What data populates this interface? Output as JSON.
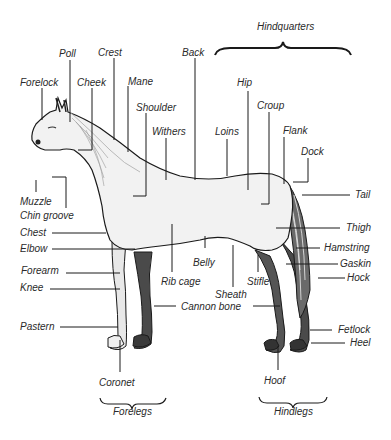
{
  "diagram": {
    "groups": {
      "hindquarters": "Hindquarters",
      "forelegs": "Forelegs",
      "hindlegs": "Hindlegs"
    },
    "labels": {
      "poll": "Poll",
      "crest": "Crest",
      "back": "Back",
      "forelock": "Forelock",
      "cheek": "Cheek",
      "mane": "Mane",
      "shoulder": "Shoulder",
      "withers": "Withers",
      "hip": "Hip",
      "croup": "Croup",
      "loins": "Loins",
      "flank": "Flank",
      "dock": "Dock",
      "tail": "Tail",
      "muzzle": "Muzzle",
      "chin_groove": "Chin groove",
      "chest": "Chest",
      "elbow": "Elbow",
      "forearm": "Forearm",
      "knee": "Knee",
      "thigh": "Thigh",
      "hamstring": "Hamstring",
      "gaskin": "Gaskin",
      "hock": "Hock",
      "belly": "Belly",
      "rib_cage": "Rib cage",
      "stifle": "Stifle",
      "sheath": "Sheath",
      "cannon_bone": "Cannon bone",
      "pastern": "Pastern",
      "fetlock": "Fetlock",
      "heel": "Heel",
      "coronet": "Coronet",
      "hoof": "Hoof"
    },
    "colors": {
      "ink": "#1a1a1a",
      "text": "#2a2a2a",
      "coat": "#f2f2f2",
      "leg_shade": "#4a4a4a"
    }
  }
}
